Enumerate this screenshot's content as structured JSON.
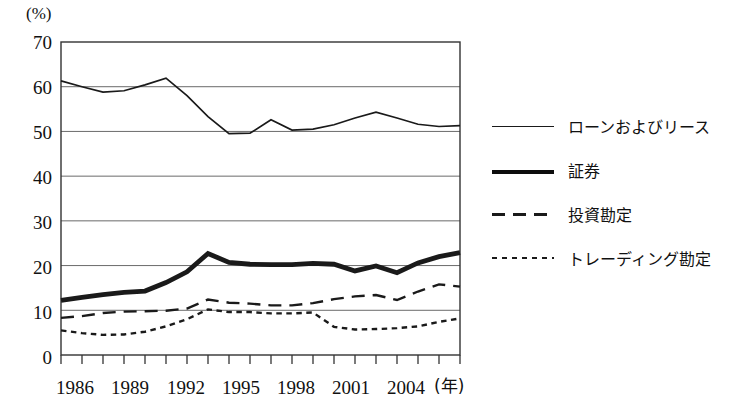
{
  "chart_data": {
    "type": "line",
    "title": "",
    "xlabel": "(年)",
    "ylabel": "(%)",
    "ylim": [
      0,
      70
    ],
    "yticks": [
      0,
      10,
      20,
      30,
      40,
      50,
      60,
      70
    ],
    "xlim": [
      1986,
      2005
    ],
    "xticks": [
      1986,
      1989,
      1992,
      1995,
      1998,
      2001,
      2004
    ],
    "x": [
      1986,
      1987,
      1988,
      1989,
      1990,
      1991,
      1992,
      1993,
      1994,
      1995,
      1996,
      1997,
      1998,
      1999,
      2000,
      2001,
      2002,
      2003,
      2004,
      2005
    ],
    "grid": true,
    "legend_position": "right",
    "series": [
      {
        "name": "ローンおよびリース",
        "style": "solid-thin",
        "values": [
          61.3,
          60.0,
          58.8,
          59.1,
          60.4,
          61.9,
          58.0,
          53.3,
          49.5,
          49.6,
          52.6,
          50.3,
          50.5,
          51.5,
          53.0,
          54.3,
          53.0,
          51.6,
          51.1,
          51.3
        ]
      },
      {
        "name": "証券",
        "style": "solid-thick",
        "values": [
          12.2,
          12.9,
          13.5,
          14.0,
          14.3,
          16.2,
          18.6,
          22.7,
          20.7,
          20.3,
          20.2,
          20.2,
          20.5,
          20.3,
          18.8,
          19.9,
          18.4,
          20.6,
          22.0,
          22.9
        ]
      },
      {
        "name": "投資勘定",
        "style": "dashed",
        "values": [
          8.3,
          8.7,
          9.4,
          9.7,
          9.8,
          9.9,
          10.4,
          12.4,
          11.7,
          11.5,
          11.1,
          11.1,
          11.6,
          12.5,
          13.1,
          13.4,
          12.3,
          14.2,
          15.8,
          15.3
        ]
      },
      {
        "name": "トレーディング勘定",
        "style": "dotted",
        "values": [
          5.5,
          4.9,
          4.5,
          4.6,
          5.2,
          6.4,
          8.0,
          10.2,
          9.6,
          9.6,
          9.3,
          9.3,
          9.5,
          6.3,
          5.7,
          5.8,
          6.0,
          6.4,
          7.4,
          8.2
        ]
      }
    ]
  },
  "axes": {
    "unit_label": "(%)",
    "x_unit_label": "(年)",
    "y_tick_labels": [
      "70",
      "60",
      "50",
      "40",
      "30",
      "20",
      "10",
      "0"
    ],
    "x_tick_labels": [
      "1986",
      "1989",
      "1992",
      "1995",
      "1998",
      "2001",
      "2004"
    ]
  },
  "legend": {
    "items": [
      {
        "label": "ローンおよびリース",
        "key": "solid-thin-key"
      },
      {
        "label": "証券",
        "key": "solid-thick-key"
      },
      {
        "label": "投資勘定",
        "key": "dashed-key"
      },
      {
        "label": "トレーディング勘定",
        "key": "dotted-key"
      }
    ]
  },
  "colors": {
    "line": "#1a1a1a",
    "grid": "#6a6a6a",
    "axis": "#333333",
    "background": "#ffffff"
  }
}
